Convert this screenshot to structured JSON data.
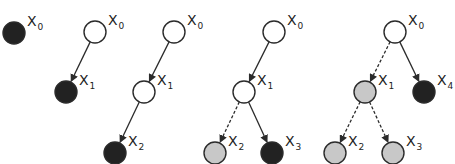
{
  "colors": {
    "stroke": "#2b2b2b",
    "empty": "#ffffff",
    "filled": "#222222",
    "partial": "#c8c8c8"
  },
  "legend_semantics": {
    "empty": "unfilled node",
    "filled": "black node",
    "partial": "gray node",
    "solid_edge": "solid arrow",
    "dashed_edge": "dashed arrow"
  },
  "trees": [
    {
      "id": "t1",
      "nodes": [
        {
          "id": "x0",
          "label": "X",
          "sub": "0",
          "cx": 14,
          "cy": 33,
          "fill": "filled"
        }
      ],
      "edges": []
    },
    {
      "id": "t2",
      "nodes": [
        {
          "id": "x0",
          "label": "X",
          "sub": "0",
          "cx": 95,
          "cy": 32,
          "fill": "empty"
        },
        {
          "id": "x1",
          "label": "X",
          "sub": "1",
          "cx": 66,
          "cy": 92,
          "fill": "filled"
        }
      ],
      "edges": [
        {
          "from": "x0",
          "to": "x1",
          "style": "solid"
        }
      ]
    },
    {
      "id": "t3",
      "nodes": [
        {
          "id": "x0",
          "label": "X",
          "sub": "0",
          "cx": 174,
          "cy": 32,
          "fill": "empty"
        },
        {
          "id": "x1",
          "label": "X",
          "sub": "1",
          "cx": 144,
          "cy": 92,
          "fill": "empty"
        },
        {
          "id": "x2",
          "label": "X",
          "sub": "2",
          "cx": 115,
          "cy": 153,
          "fill": "filled"
        }
      ],
      "edges": [
        {
          "from": "x0",
          "to": "x1",
          "style": "solid"
        },
        {
          "from": "x1",
          "to": "x2",
          "style": "solid"
        }
      ]
    },
    {
      "id": "t4",
      "nodes": [
        {
          "id": "x0",
          "label": "X",
          "sub": "0",
          "cx": 274,
          "cy": 32,
          "fill": "empty"
        },
        {
          "id": "x1",
          "label": "X",
          "sub": "1",
          "cx": 244,
          "cy": 92,
          "fill": "empty"
        },
        {
          "id": "x2",
          "label": "X",
          "sub": "2",
          "cx": 215,
          "cy": 153,
          "fill": "partial"
        },
        {
          "id": "x3",
          "label": "X",
          "sub": "3",
          "cx": 272,
          "cy": 153,
          "fill": "filled"
        }
      ],
      "edges": [
        {
          "from": "x0",
          "to": "x1",
          "style": "solid"
        },
        {
          "from": "x1",
          "to": "x2",
          "style": "dashed"
        },
        {
          "from": "x1",
          "to": "x3",
          "style": "solid"
        }
      ]
    },
    {
      "id": "t5",
      "nodes": [
        {
          "id": "x0",
          "label": "X",
          "sub": "0",
          "cx": 395,
          "cy": 32,
          "fill": "empty"
        },
        {
          "id": "x1",
          "label": "X",
          "sub": "1",
          "cx": 365,
          "cy": 92,
          "fill": "partial"
        },
        {
          "id": "x4",
          "label": "X",
          "sub": "4",
          "cx": 424,
          "cy": 92,
          "fill": "filled"
        },
        {
          "id": "x2",
          "label": "X",
          "sub": "2",
          "cx": 335,
          "cy": 153,
          "fill": "partial"
        },
        {
          "id": "x3",
          "label": "X",
          "sub": "3",
          "cx": 393,
          "cy": 153,
          "fill": "partial"
        }
      ],
      "edges": [
        {
          "from": "x0",
          "to": "x1",
          "style": "dashed"
        },
        {
          "from": "x0",
          "to": "x4",
          "style": "solid"
        },
        {
          "from": "x1",
          "to": "x2",
          "style": "dashed"
        },
        {
          "from": "x1",
          "to": "x3",
          "style": "dashed"
        }
      ]
    }
  ]
}
